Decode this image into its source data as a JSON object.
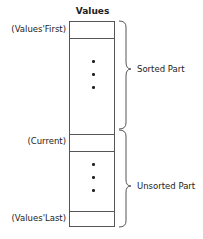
{
  "diagram": {
    "title": "Values",
    "index_labels": {
      "first": "(Values'First)",
      "current": "(Current)",
      "last": "(Values'Last)"
    },
    "regions": {
      "sorted": "Sorted Part",
      "unsorted": "Unsorted Part"
    },
    "colors": {
      "line": "#555555",
      "text": "#222222",
      "background": "#ffffff"
    }
  }
}
